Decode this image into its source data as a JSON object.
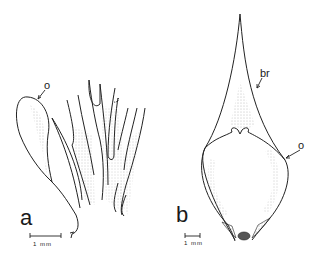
{
  "figure": {
    "panel_a": {
      "letter": "a",
      "callout_o": "o",
      "scale_bar": "1 mm"
    },
    "panel_b": {
      "letter": "b",
      "callout_br": "br",
      "callout_o": "o",
      "scale_bar": "1 mm"
    }
  }
}
